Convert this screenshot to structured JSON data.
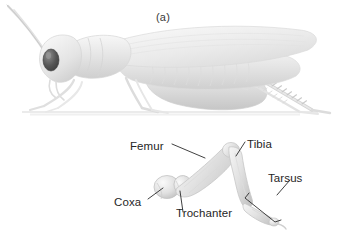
{
  "figure": {
    "background_color": "#ffffff",
    "width": 343,
    "height": 231,
    "text_color": "#262626",
    "caption_color": "#3a3a3a",
    "body_fill": "#e8e8e8",
    "body_shade": "#d2d2d2",
    "body_light": "#f4f4f4",
    "eye_color": "#4a4a4a",
    "leader_color": "#2b2b2b"
  },
  "panel_a": {
    "caption": "(a)",
    "subject": "grasshopper-lateral-view",
    "parts": [
      "antenna",
      "head",
      "compound-eye",
      "pronotum",
      "thorax",
      "forewing",
      "abdomen",
      "foreleg",
      "midleg",
      "hind-femur",
      "hind-tibia",
      "hind-tarsus",
      "ground-line"
    ]
  },
  "panel_b": {
    "caption": "(b)",
    "subject": "grasshopper-hind-leg-segments",
    "labels": [
      {
        "id": "femur",
        "text": "Femur"
      },
      {
        "id": "tibia",
        "text": "Tibia"
      },
      {
        "id": "coxa",
        "text": "Coxa"
      },
      {
        "id": "trochanter",
        "text": "Trochanter"
      },
      {
        "id": "tarsus",
        "text": "Tarsus"
      }
    ]
  }
}
